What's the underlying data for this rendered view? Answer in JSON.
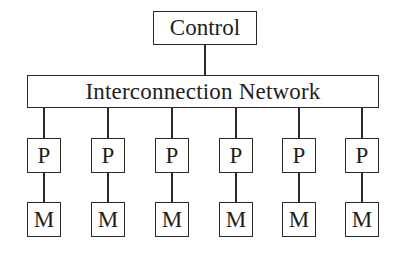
{
  "diagram": {
    "control": {
      "label": "Control"
    },
    "network": {
      "label": "Interconnection Network"
    },
    "nodes": [
      {
        "processor": "P",
        "memory": "M",
        "x": 44
      },
      {
        "processor": "P",
        "memory": "M",
        "x": 108
      },
      {
        "processor": "P",
        "memory": "M",
        "x": 172
      },
      {
        "processor": "P",
        "memory": "M",
        "x": 236
      },
      {
        "processor": "P",
        "memory": "M",
        "x": 299
      },
      {
        "processor": "P",
        "memory": "M",
        "x": 362
      }
    ],
    "edges": [
      [
        "Control",
        "Interconnection Network"
      ],
      [
        "Interconnection Network",
        "P1"
      ],
      [
        "P1",
        "M1"
      ],
      [
        "Interconnection Network",
        "P2"
      ],
      [
        "P2",
        "M2"
      ],
      [
        "Interconnection Network",
        "P3"
      ],
      [
        "P3",
        "M3"
      ],
      [
        "Interconnection Network",
        "P4"
      ],
      [
        "P4",
        "M4"
      ],
      [
        "Interconnection Network",
        "P5"
      ],
      [
        "P5",
        "M5"
      ],
      [
        "Interconnection Network",
        "P6"
      ],
      [
        "P6",
        "M6"
      ]
    ]
  }
}
